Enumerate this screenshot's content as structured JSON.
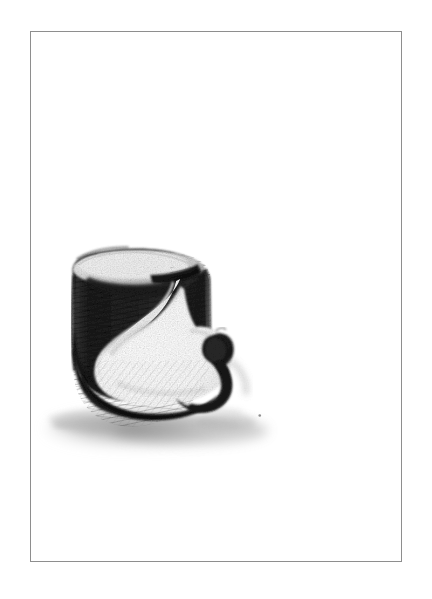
{
  "page": {
    "background_color": "#ffffff",
    "width": 432,
    "height": 599,
    "title": "Charcoal study of a carved cylindrical form"
  },
  "frame": {
    "name": "plate-border",
    "stroke_color": "#8e8e8e",
    "stroke_width": 1,
    "x": 30,
    "y": 31,
    "width": 372,
    "height": 531,
    "fill_color": "#ffffff"
  },
  "artwork": {
    "medium": "graphite / charcoal pencil drawing",
    "subject": "cylinder with spiral carved cut-away and hooked curl",
    "palette": {
      "darkest": "#171717",
      "dark": "#2e2e2e",
      "mid": "#5e5e5e",
      "light_grey": "#b4b4b4",
      "pale": "#e2e2e2",
      "highlight": "#ffffff",
      "shadow": "#9a9a9a"
    },
    "bounds": {
      "x": 70,
      "y": 258,
      "width": 175,
      "height": 205
    },
    "elements": [
      {
        "name": "cylinder-top-ellipse",
        "tone": "pale",
        "note": "light elliptical top face of the cylinder"
      },
      {
        "name": "cylinder-left-wall",
        "tone": "darkest",
        "note": "heavily hatched dark outer wall on the left"
      },
      {
        "name": "cylinder-right-wall",
        "tone": "dark",
        "note": "dark inner wall of the cut, right of centre"
      },
      {
        "name": "spiral-inner-surface",
        "tone": "highlight",
        "note": "broad white curved scooped surface"
      },
      {
        "name": "hook-curl",
        "tone": "darkest",
        "note": "claw-like curled tab protruding to the lower right"
      },
      {
        "name": "cast-shadow",
        "tone": "shadow",
        "note": "soft smudged shadow spreading at the base"
      },
      {
        "name": "stray-mark",
        "tone": "mid",
        "note": "small isolated pencil dot to the right of the shadow"
      }
    ]
  }
}
